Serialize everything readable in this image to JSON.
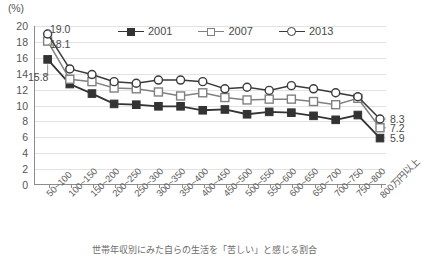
{
  "axis": {
    "unit_label": "(%)",
    "y_ticks": [
      0,
      2,
      4,
      6,
      8,
      10,
      12,
      14,
      16,
      18,
      20
    ],
    "y_min": 0,
    "y_max": 20
  },
  "legend": {
    "items": [
      {
        "label": "2001",
        "marker": "filled-square",
        "color": "#333333"
      },
      {
        "label": "2007",
        "marker": "open-square",
        "color": "#808080"
      },
      {
        "label": "2013",
        "marker": "open-circle",
        "color": "#3a3a3a"
      }
    ]
  },
  "callouts": [
    {
      "name": "callout-2013-first",
      "value": "19.0"
    },
    {
      "name": "callout-2007-first",
      "value": "18.1"
    },
    {
      "name": "callout-2001-first",
      "value": "15.8"
    }
  ],
  "end_labels": [
    {
      "name": "endlabel-2013",
      "value": "8.3"
    },
    {
      "name": "endlabel-2007",
      "value": "7.2"
    },
    {
      "name": "endlabel-2001",
      "value": "5.9"
    }
  ],
  "caption": "世帯年収別にみた自らの生活を「苦しい」と感じる割合",
  "chart_data": {
    "type": "line",
    "title": "",
    "xlabel": "",
    "ylabel": "(%)",
    "ylim": [
      0,
      20
    ],
    "grid": true,
    "legend_position": "top-center",
    "categories": [
      "50~100",
      "100~150",
      "150~200",
      "200~250",
      "250~300",
      "300~350",
      "350~400",
      "400~450",
      "450~500",
      "500~550",
      "550~600",
      "600~650",
      "650~700",
      "700~750",
      "750~800",
      "800万円以上"
    ],
    "series": [
      {
        "name": "2001",
        "marker": "filled-square",
        "color": "#333333",
        "values": [
          15.8,
          12.7,
          11.5,
          10.2,
          10.1,
          9.9,
          9.9,
          9.4,
          9.5,
          8.9,
          9.2,
          9.1,
          8.7,
          8.2,
          8.8,
          5.9
        ]
      },
      {
        "name": "2007",
        "marker": "open-square",
        "color": "#808080",
        "values": [
          18.1,
          13.3,
          13.0,
          12.2,
          12.1,
          11.7,
          11.2,
          11.6,
          11.0,
          10.7,
          10.8,
          10.8,
          10.5,
          10.1,
          10.9,
          7.2
        ]
      },
      {
        "name": "2013",
        "marker": "open-circle",
        "color": "#3a3a3a",
        "values": [
          19.0,
          14.6,
          13.9,
          13.0,
          12.8,
          13.2,
          13.2,
          13.0,
          12.1,
          12.3,
          11.9,
          12.5,
          12.1,
          11.6,
          11.1,
          8.3
        ]
      }
    ]
  }
}
